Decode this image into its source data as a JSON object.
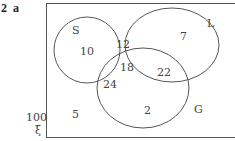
{
  "question": {
    "number": "2",
    "part": "a"
  },
  "universal": {
    "total": "100",
    "symbol": "ξ"
  },
  "sets": {
    "S": "S",
    "L": "L",
    "G": "G"
  },
  "regions": {
    "s_only": "10",
    "s_l": "12",
    "s_l_g": "18",
    "s_g": "24",
    "l_only": "7",
    "l_g": "22",
    "g_only": "2",
    "none": "5"
  }
}
